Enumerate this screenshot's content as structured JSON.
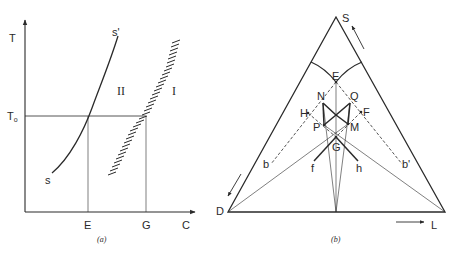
{
  "figure_a": {
    "caption": "(a)",
    "y_axis_label": "T",
    "x_axis_label": "C",
    "t0_label": "T",
    "t0_subscript": "o",
    "x_marks": [
      "E",
      "G"
    ],
    "curve_start_label": "s",
    "curve_end_label": "s'",
    "region_left_label": "II",
    "region_right_label": "I"
  },
  "figure_b": {
    "caption": "(b)",
    "vertices": {
      "top": "S",
      "left": "D",
      "right": "L"
    },
    "points": {
      "E": "E",
      "N": "N",
      "Q": "Q",
      "H": "H",
      "F": "F",
      "P": "P",
      "M": "M",
      "G": "G",
      "f": "f",
      "h": "h",
      "b": "b",
      "b_prime": "b'"
    }
  },
  "colors": {
    "ink": "#2a2a2a",
    "background": "#ffffff"
  }
}
